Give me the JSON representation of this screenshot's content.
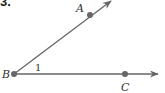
{
  "problem_number": "3.",
  "diagram": {
    "type": "angle",
    "vertex": {
      "label": "B",
      "x": 14,
      "y": 74
    },
    "points": [
      {
        "label": "A",
        "x": 90,
        "y": 15,
        "label_x": 76,
        "label_y": 12
      },
      {
        "label": "C",
        "x": 125,
        "y": 74,
        "label_x": 121,
        "label_y": 91
      }
    ],
    "angle_label": "1",
    "angle_label_pos": {
      "x": 35,
      "y": 71
    },
    "vertex_label_pos": {
      "x": 2,
      "y": 78
    },
    "ray_color": "#666666",
    "point_color": "#666666"
  }
}
